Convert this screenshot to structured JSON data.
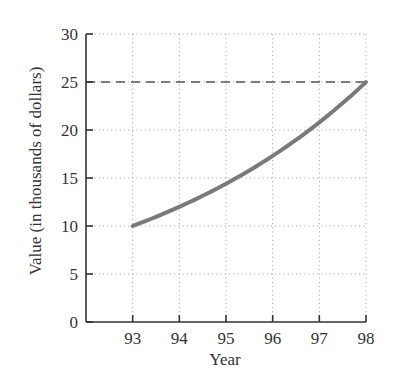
{
  "chart_data": {
    "type": "line",
    "title": "",
    "xlabel": "Year",
    "ylabel": "Value (in thousands of dollars)",
    "x_ticks": [
      "93",
      "94",
      "95",
      "96",
      "97",
      "98"
    ],
    "y_ticks": [
      "0",
      "5",
      "10",
      "15",
      "20",
      "25",
      "30"
    ],
    "xlim": [
      92,
      98
    ],
    "ylim": [
      0,
      30
    ],
    "grid": true,
    "grid_style": "dotted",
    "legend": null,
    "series": [
      {
        "name": "Value",
        "style": "solid",
        "color": "#7a7a7a",
        "x": [
          93,
          94,
          95,
          96,
          97,
          98
        ],
        "values": [
          10.0,
          12.0,
          14.4,
          17.3,
          20.8,
          25.0
        ]
      }
    ],
    "reference_lines": [
      {
        "orientation": "horizontal",
        "y": 25,
        "style": "dashed",
        "x_range": [
          92,
          98
        ],
        "color": "#555555"
      }
    ]
  },
  "axes": {
    "x_title": "Year",
    "y_title": "Value (in thousands of dollars)"
  },
  "colors": {
    "curve": "#7a7a7a",
    "axis": "#333333",
    "grid": "#aaaaaa",
    "dashed_line": "#555555"
  }
}
